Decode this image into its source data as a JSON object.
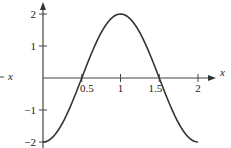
{
  "chart_data": {
    "type": "line",
    "title": "",
    "xlabel": "x",
    "ylabel": "",
    "xlim": [
      0,
      2
    ],
    "ylim": [
      -2,
      2
    ],
    "grid": false,
    "legend": null,
    "x_ticks": [
      0.5,
      1,
      1.5,
      2
    ],
    "x_tick_labels": [
      "0.5",
      "1",
      "1.5",
      "2"
    ],
    "y_ticks": [
      -2,
      -1,
      1,
      2
    ],
    "y_tick_labels": [
      "−2",
      "−1",
      "1",
      "2"
    ],
    "series": [
      {
        "name": "y = -2cos(πx)",
        "x": [
          0,
          0.25,
          0.5,
          0.75,
          1,
          1.25,
          1.5,
          1.75,
          2
        ],
        "values": [
          -2,
          -1.414,
          0,
          1.414,
          2,
          1.414,
          0,
          -1.414,
          -2
        ],
        "color": "#333333"
      }
    ],
    "annotations": [
      {
        "text": "x",
        "position": "left-edge, cropped axis label"
      }
    ]
  },
  "colors": {
    "axis": "#444444",
    "curve": "#333333",
    "text": "#222222"
  }
}
